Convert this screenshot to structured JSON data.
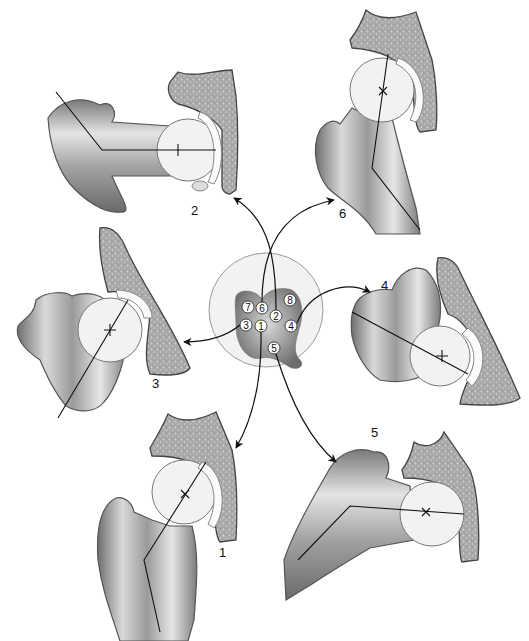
{
  "figure": {
    "center_map": {
      "zones": [
        {
          "id": "zone-7",
          "label": "7"
        },
        {
          "id": "zone-6",
          "label": "6"
        },
        {
          "id": "zone-2",
          "label": "2"
        },
        {
          "id": "zone-8",
          "label": "8"
        },
        {
          "id": "zone-3",
          "label": "3"
        },
        {
          "id": "zone-1",
          "label": "1"
        },
        {
          "id": "zone-4",
          "label": "4"
        },
        {
          "id": "zone-5",
          "label": "5"
        }
      ]
    },
    "views": [
      {
        "id": "view-1",
        "label": "1"
      },
      {
        "id": "view-2",
        "label": "2"
      },
      {
        "id": "view-3",
        "label": "3"
      },
      {
        "id": "view-4",
        "label": "4"
      },
      {
        "id": "view-5",
        "label": "5"
      },
      {
        "id": "view-6",
        "label": "6"
      }
    ],
    "colors": {
      "bone_dark": "#8a8a8a",
      "bone_light": "#f0f0f0",
      "pelvis_fill": "#a8a8a8",
      "line": "#111111"
    }
  }
}
